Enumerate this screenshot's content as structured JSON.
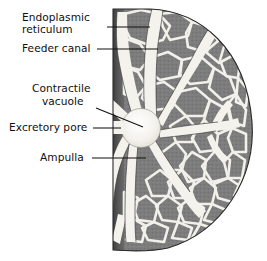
{
  "figure": {
    "background_color": "#ffffff",
    "cytoplasm_color": "#7d7d7d",
    "cytoplasm_dark_color": "#5d5d5d",
    "canal_color": "#f3f1ec",
    "membrane_color": "#4a4a4a",
    "outline_color": "#2a2a2a",
    "leader_color": "#111111",
    "text_color": "#101010"
  },
  "labels": [
    {
      "id": "endoplasmic-reticulum",
      "line1": "Endoplasmic",
      "line2": "reticulum",
      "text_x": 22,
      "text_y1": 21,
      "text_y2": 33,
      "leader": "M 107 27 L 150 27"
    },
    {
      "id": "feeder-canal",
      "line1": "Feeder canal",
      "line2": "",
      "text_x": 22,
      "text_y1": 52,
      "text_y2": 0,
      "leader": "M 97 49 L 158 49"
    },
    {
      "id": "contractile-vacuole",
      "line1": "Contractile",
      "line2": "vacuole",
      "text_x": 32,
      "text_y1": 92,
      "text_y2": 105,
      "leader": "M 96 108 L 142 127"
    },
    {
      "id": "excretory-pore",
      "line1": "Excretory pore",
      "line2": "",
      "text_x": 12,
      "text_y1": 131,
      "text_y2": 0,
      "leader": "M 93 128 L 120 128"
    },
    {
      "id": "ampulla",
      "line1": "Ampulla",
      "line2": "",
      "text_x": 40,
      "text_y1": 161,
      "text_y2": 0,
      "leader": "M 92 158 L 145 158"
    }
  ],
  "structures": {
    "cell_shape": "half-circle",
    "membrane_x": 113,
    "cell_top_y": 9,
    "cell_bottom_y": 250,
    "cell_right_x": 253,
    "vacuole": {
      "cx": 141,
      "cy": 128,
      "r": 19,
      "name": "contractile vacuole"
    },
    "radiating_canal_count": 10,
    "pore": {
      "x": 112,
      "y": 128,
      "name": "excretory pore"
    }
  }
}
